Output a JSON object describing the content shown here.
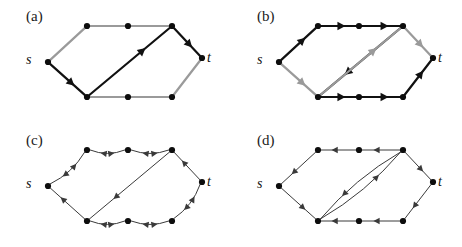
{
  "figure": {
    "width": 462,
    "height": 247,
    "background": "#ffffff",
    "panel_count": 4
  },
  "colors": {
    "node": "#0d0d0d",
    "edge_black": "#111111",
    "edge_gray": "#9a9a9a",
    "arrow_black": "#111111",
    "arrow_gray": "#9a9a9a",
    "edge_thin": "#3a3a3a",
    "label_text": "#1a1a1a",
    "terminal_text": "#111111"
  },
  "terminals": {
    "source_label": "s",
    "sink_label": "t"
  },
  "panels": [
    {
      "id": "panel-a",
      "label": "(a)",
      "label_x": 26,
      "label_y": 8,
      "origin_x": 0,
      "origin_y": 0,
      "source_label": "s",
      "sink_label": "t",
      "source_text_x": 26,
      "source_text_y": 52,
      "sink_text_x": 207,
      "sink_text_y": 50,
      "style": "mixed-black-gray-thick",
      "nodes": [
        {
          "name": "s",
          "x": 48,
          "y": 62
        },
        {
          "name": "tl",
          "x": 87,
          "y": 26
        },
        {
          "name": "tm",
          "x": 128,
          "y": 26
        },
        {
          "name": "tr",
          "x": 172,
          "y": 26
        },
        {
          "name": "t",
          "x": 202,
          "y": 58
        },
        {
          "name": "br",
          "x": 172,
          "y": 97
        },
        {
          "name": "bm",
          "x": 128,
          "y": 97
        },
        {
          "name": "bl",
          "x": 87,
          "y": 97
        }
      ],
      "edges": [
        {
          "from": "s",
          "to": "tl",
          "color": "gray",
          "arrow": "none",
          "weight": "thick"
        },
        {
          "from": "tl",
          "to": "tm",
          "color": "gray",
          "arrow": "none",
          "weight": "thick"
        },
        {
          "from": "tm",
          "to": "tr",
          "color": "gray",
          "arrow": "none",
          "weight": "thick"
        },
        {
          "from": "s",
          "to": "bl",
          "color": "black",
          "arrow": "forward",
          "weight": "thick"
        },
        {
          "from": "bl",
          "to": "tr",
          "color": "black",
          "arrow": "forward",
          "weight": "thick"
        },
        {
          "from": "tr",
          "to": "t",
          "color": "black",
          "arrow": "forward",
          "weight": "thick"
        },
        {
          "from": "bl",
          "to": "bm",
          "color": "gray",
          "arrow": "none",
          "weight": "thick"
        },
        {
          "from": "bm",
          "to": "br",
          "color": "gray",
          "arrow": "none",
          "weight": "thick"
        },
        {
          "from": "br",
          "to": "t",
          "color": "gray",
          "arrow": "none",
          "weight": "thick"
        }
      ]
    },
    {
      "id": "panel-b",
      "label": "(b)",
      "label_x": 26,
      "label_y": 8,
      "origin_x": 231,
      "origin_y": 0,
      "source_label": "s",
      "sink_label": "t",
      "source_text_x": 26,
      "source_text_y": 52,
      "sink_text_x": 207,
      "sink_text_y": 50,
      "style": "all-directed-thick",
      "nodes": [
        {
          "name": "s",
          "x": 48,
          "y": 62
        },
        {
          "name": "tl",
          "x": 87,
          "y": 26
        },
        {
          "name": "tm",
          "x": 128,
          "y": 26
        },
        {
          "name": "tr",
          "x": 172,
          "y": 26
        },
        {
          "name": "t",
          "x": 202,
          "y": 58
        },
        {
          "name": "br",
          "x": 172,
          "y": 97
        },
        {
          "name": "bm",
          "x": 128,
          "y": 97
        },
        {
          "name": "bl",
          "x": 87,
          "y": 97
        }
      ],
      "edges": [
        {
          "from": "s",
          "to": "tl",
          "color": "black",
          "arrow": "forward",
          "weight": "thick"
        },
        {
          "from": "tl",
          "to": "tm",
          "color": "black",
          "arrow": "forward",
          "weight": "thick"
        },
        {
          "from": "tm",
          "to": "tr",
          "color": "black",
          "arrow": "forward",
          "weight": "thick"
        },
        {
          "from": "s",
          "to": "bl",
          "color": "gray",
          "arrow": "forward",
          "weight": "thick"
        },
        {
          "from": "tr",
          "to": "bl",
          "color": "black",
          "arrow": "forward",
          "weight": "thick"
        },
        {
          "from": "bl",
          "to": "tr",
          "color": "gray",
          "arrow": "forward",
          "weight": "thick"
        },
        {
          "from": "tr",
          "to": "t",
          "color": "gray",
          "arrow": "forward",
          "weight": "thick"
        },
        {
          "from": "bl",
          "to": "bm",
          "color": "black",
          "arrow": "forward",
          "weight": "thick"
        },
        {
          "from": "bm",
          "to": "br",
          "color": "black",
          "arrow": "forward",
          "weight": "thick"
        },
        {
          "from": "br",
          "to": "t",
          "color": "black",
          "arrow": "forward",
          "weight": "thick"
        }
      ]
    },
    {
      "id": "panel-c",
      "label": "(c)",
      "label_x": 26,
      "label_y": 8,
      "origin_x": 0,
      "origin_y": 124,
      "source_label": "s",
      "sink_label": "t",
      "source_text_x": 26,
      "source_text_y": 52,
      "sink_text_x": 207,
      "sink_text_y": 50,
      "style": "bidirectional-curved-thin",
      "nodes": [
        {
          "name": "s",
          "x": 48,
          "y": 62
        },
        {
          "name": "tl",
          "x": 87,
          "y": 26
        },
        {
          "name": "tm",
          "x": 128,
          "y": 26
        },
        {
          "name": "tr",
          "x": 172,
          "y": 26
        },
        {
          "name": "t",
          "x": 202,
          "y": 58
        },
        {
          "name": "br",
          "x": 172,
          "y": 97
        },
        {
          "name": "bm",
          "x": 128,
          "y": 97
        },
        {
          "name": "bl",
          "x": 87,
          "y": 97
        }
      ],
      "edges": [
        {
          "from": "s",
          "to": "tl",
          "color": "thin",
          "arrow": "both",
          "weight": "thin",
          "curve": 7
        },
        {
          "from": "tl",
          "to": "tm",
          "color": "thin",
          "arrow": "both",
          "weight": "thin",
          "curve": 7
        },
        {
          "from": "tm",
          "to": "tr",
          "color": "thin",
          "arrow": "both",
          "weight": "thin",
          "curve": 7
        },
        {
          "from": "bl",
          "to": "s",
          "color": "thin",
          "arrow": "forward",
          "weight": "thin",
          "curve": 0
        },
        {
          "from": "tr",
          "to": "bl",
          "color": "thin",
          "arrow": "forward",
          "weight": "thin",
          "curve": 0
        },
        {
          "from": "tr",
          "to": "t",
          "color": "thin",
          "arrow": "backward",
          "weight": "thin",
          "curve": 0
        },
        {
          "from": "bl",
          "to": "bm",
          "color": "thin",
          "arrow": "both",
          "weight": "thin",
          "curve": 7
        },
        {
          "from": "bm",
          "to": "br",
          "color": "thin",
          "arrow": "both",
          "weight": "thin",
          "curve": 7
        },
        {
          "from": "br",
          "to": "t",
          "color": "thin",
          "arrow": "both",
          "weight": "thin",
          "curve": 7
        }
      ]
    },
    {
      "id": "panel-d",
      "label": "(d)",
      "label_x": 26,
      "label_y": 8,
      "origin_x": 231,
      "origin_y": 124,
      "source_label": "s",
      "sink_label": "t",
      "source_text_x": 26,
      "source_text_y": 52,
      "sink_text_x": 207,
      "sink_text_y": 50,
      "style": "directed-thin-with-curved-pair",
      "nodes": [
        {
          "name": "s",
          "x": 48,
          "y": 62
        },
        {
          "name": "tl",
          "x": 87,
          "y": 26
        },
        {
          "name": "tm",
          "x": 128,
          "y": 26
        },
        {
          "name": "tr",
          "x": 172,
          "y": 26
        },
        {
          "name": "t",
          "x": 202,
          "y": 58
        },
        {
          "name": "br",
          "x": 172,
          "y": 97
        },
        {
          "name": "bm",
          "x": 128,
          "y": 97
        },
        {
          "name": "bl",
          "x": 87,
          "y": 97
        }
      ],
      "edges": [
        {
          "from": "tl",
          "to": "s",
          "color": "thin",
          "arrow": "forward",
          "weight": "thin",
          "curve": 0
        },
        {
          "from": "tm",
          "to": "tl",
          "color": "thin",
          "arrow": "forward",
          "weight": "thin",
          "curve": 0
        },
        {
          "from": "tr",
          "to": "tm",
          "color": "thin",
          "arrow": "forward",
          "weight": "thin",
          "curve": 0
        },
        {
          "from": "s",
          "to": "bl",
          "color": "thin",
          "arrow": "forward",
          "weight": "thin",
          "curve": 0
        },
        {
          "from": "bl",
          "to": "tr",
          "color": "thin",
          "arrow": "forward",
          "weight": "thin",
          "curve": 9
        },
        {
          "from": "tr",
          "to": "bl",
          "color": "thin",
          "arrow": "forward",
          "weight": "thin",
          "curve": 9
        },
        {
          "from": "tr",
          "to": "t",
          "color": "thin",
          "arrow": "forward",
          "weight": "thin",
          "curve": 0
        },
        {
          "from": "bm",
          "to": "bl",
          "color": "thin",
          "arrow": "forward",
          "weight": "thin",
          "curve": 0
        },
        {
          "from": "br",
          "to": "bm",
          "color": "thin",
          "arrow": "forward",
          "weight": "thin",
          "curve": 0
        },
        {
          "from": "t",
          "to": "br",
          "color": "thin",
          "arrow": "forward",
          "weight": "thin",
          "curve": 0
        }
      ]
    }
  ]
}
